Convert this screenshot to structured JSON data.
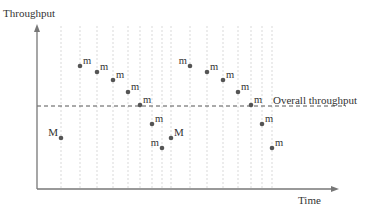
{
  "chart_data": {
    "type": "scatter",
    "title": "",
    "xlabel": "Time",
    "ylabel": "Throughput",
    "reference_line": {
      "label": "Overall throughput",
      "y": 106
    },
    "axis_color": "#777777",
    "point_color": "#555555",
    "grid": "vertical dotted lines at each point",
    "points": [
      {
        "x": 61,
        "y": 138,
        "label": "M",
        "label_side": "left"
      },
      {
        "x": 80,
        "y": 66,
        "label": "m"
      },
      {
        "x": 97,
        "y": 72,
        "label": "m"
      },
      {
        "x": 113,
        "y": 80,
        "label": "m"
      },
      {
        "x": 128,
        "y": 92,
        "label": "m"
      },
      {
        "x": 140,
        "y": 105,
        "label": "m"
      },
      {
        "x": 152,
        "y": 124,
        "label": "m"
      },
      {
        "x": 162,
        "y": 148,
        "label": "m",
        "label_side": "left"
      },
      {
        "x": 171,
        "y": 138,
        "label": "M"
      },
      {
        "x": 190,
        "y": 66,
        "label": "m",
        "label_side": "left"
      },
      {
        "x": 207,
        "y": 72,
        "label": "m"
      },
      {
        "x": 223,
        "y": 80,
        "label": "m"
      },
      {
        "x": 238,
        "y": 92,
        "label": "m"
      },
      {
        "x": 251,
        "y": 105,
        "label": "m"
      },
      {
        "x": 262,
        "y": 124,
        "label": "m"
      },
      {
        "x": 272,
        "y": 148,
        "label": "m"
      }
    ]
  },
  "labels": {
    "y_axis": "Throughput",
    "x_axis": "Time",
    "reference": "Overall throughput"
  }
}
